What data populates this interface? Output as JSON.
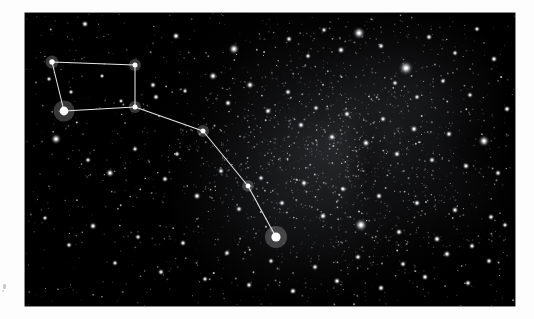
{
  "image": {
    "kind": "astronomical-photograph",
    "subject": "Big Dipper asterism in Ursa Major",
    "alt_text": "Black-and-white wide-field photograph of a dense star field with the Big Dipper asterism outlined by thin white connecting lines",
    "background_color": "#ffffff",
    "plate_color": "#000000",
    "line_color": "#e8e8e8",
    "star_color": "#ffffff",
    "frame": {
      "left": 25,
      "top": 13,
      "width": 490,
      "height": 293
    }
  },
  "chart_data": {
    "type": "scatter",
    "title": "",
    "subtitle": "",
    "xlabel": "",
    "ylabel": "",
    "grid": false,
    "legend": null,
    "xlim": [
      0,
      490
    ],
    "ylim": [
      0,
      293
    ],
    "constellation": {
      "name": "Big Dipper",
      "nodes": [
        {
          "id": "n1",
          "x": 27,
          "y": 49,
          "r": 2.7,
          "brightness": "bright"
        },
        {
          "id": "n2",
          "x": 110,
          "y": 52,
          "r": 2.5,
          "brightness": "bright"
        },
        {
          "id": "n3",
          "x": 110,
          "y": 94,
          "r": 2.5,
          "brightness": "bright"
        },
        {
          "id": "n4",
          "x": 39,
          "y": 98,
          "r": 4.4,
          "brightness": "very-bright"
        },
        {
          "id": "n5",
          "x": 178,
          "y": 118,
          "r": 2.5,
          "brightness": "bright"
        },
        {
          "id": "n6",
          "x": 223,
          "y": 173,
          "r": 2.4,
          "brightness": "bright"
        },
        {
          "id": "n7",
          "x": 251,
          "y": 224,
          "r": 4.6,
          "brightness": "very-bright"
        }
      ],
      "segments": [
        [
          "n1",
          "n2"
        ],
        [
          "n2",
          "n3"
        ],
        [
          "n3",
          "n4"
        ],
        [
          "n4",
          "n1"
        ],
        [
          "n3",
          "n5"
        ],
        [
          "n5",
          "n6"
        ],
        [
          "n6",
          "n7"
        ]
      ]
    },
    "field_stars": [
      {
        "x": 60,
        "y": 11,
        "r": 1.5
      },
      {
        "x": 151,
        "y": 23,
        "r": 1.6
      },
      {
        "x": 209,
        "y": 36,
        "r": 2.3
      },
      {
        "x": 264,
        "y": 26,
        "r": 1.4
      },
      {
        "x": 283,
        "y": 43,
        "r": 1.3
      },
      {
        "x": 299,
        "y": 17,
        "r": 1.3
      },
      {
        "x": 316,
        "y": 37,
        "r": 1.6
      },
      {
        "x": 334,
        "y": 20,
        "r": 2.6
      },
      {
        "x": 356,
        "y": 33,
        "r": 1.4
      },
      {
        "x": 381,
        "y": 55,
        "r": 3.0
      },
      {
        "x": 404,
        "y": 24,
        "r": 1.4
      },
      {
        "x": 430,
        "y": 40,
        "r": 1.3
      },
      {
        "x": 452,
        "y": 16,
        "r": 1.3
      },
      {
        "x": 469,
        "y": 46,
        "r": 1.5
      },
      {
        "x": 24,
        "y": 66,
        "r": 1.2
      },
      {
        "x": 46,
        "y": 79,
        "r": 1.2
      },
      {
        "x": 77,
        "y": 63,
        "r": 1.1
      },
      {
        "x": 96,
        "y": 88,
        "r": 1.1
      },
      {
        "x": 128,
        "y": 72,
        "r": 1.4
      },
      {
        "x": 131,
        "y": 84,
        "r": 1.4
      },
      {
        "x": 160,
        "y": 78,
        "r": 1.2
      },
      {
        "x": 188,
        "y": 63,
        "r": 1.8
      },
      {
        "x": 203,
        "y": 90,
        "r": 1.5
      },
      {
        "x": 225,
        "y": 72,
        "r": 1.7
      },
      {
        "x": 243,
        "y": 98,
        "r": 1.5
      },
      {
        "x": 263,
        "y": 79,
        "r": 1.4
      },
      {
        "x": 276,
        "y": 112,
        "r": 1.5
      },
      {
        "x": 291,
        "y": 95,
        "r": 1.3
      },
      {
        "x": 307,
        "y": 124,
        "r": 1.6
      },
      {
        "x": 322,
        "y": 101,
        "r": 1.5
      },
      {
        "x": 341,
        "y": 130,
        "r": 1.7
      },
      {
        "x": 358,
        "y": 106,
        "r": 1.4
      },
      {
        "x": 372,
        "y": 141,
        "r": 1.5
      },
      {
        "x": 389,
        "y": 116,
        "r": 1.6
      },
      {
        "x": 407,
        "y": 147,
        "r": 1.4
      },
      {
        "x": 424,
        "y": 121,
        "r": 1.5
      },
      {
        "x": 441,
        "y": 153,
        "r": 1.5
      },
      {
        "x": 459,
        "y": 128,
        "r": 2.4
      },
      {
        "x": 473,
        "y": 160,
        "r": 1.4
      },
      {
        "x": 31,
        "y": 126,
        "r": 2.2
      },
      {
        "x": 63,
        "y": 147,
        "r": 1.3
      },
      {
        "x": 85,
        "y": 160,
        "r": 1.8
      },
      {
        "x": 110,
        "y": 136,
        "r": 1.3
      },
      {
        "x": 140,
        "y": 166,
        "r": 1.4
      },
      {
        "x": 152,
        "y": 141,
        "r": 1.3
      },
      {
        "x": 172,
        "y": 183,
        "r": 1.6
      },
      {
        "x": 196,
        "y": 158,
        "r": 1.4
      },
      {
        "x": 214,
        "y": 196,
        "r": 1.4
      },
      {
        "x": 236,
        "y": 165,
        "r": 1.3
      },
      {
        "x": 257,
        "y": 190,
        "r": 1.4
      },
      {
        "x": 279,
        "y": 170,
        "r": 1.5
      },
      {
        "x": 298,
        "y": 203,
        "r": 1.6
      },
      {
        "x": 318,
        "y": 176,
        "r": 1.4
      },
      {
        "x": 336,
        "y": 212,
        "r": 2.7
      },
      {
        "x": 354,
        "y": 183,
        "r": 1.5
      },
      {
        "x": 374,
        "y": 219,
        "r": 1.5
      },
      {
        "x": 392,
        "y": 190,
        "r": 1.5
      },
      {
        "x": 412,
        "y": 226,
        "r": 1.6
      },
      {
        "x": 430,
        "y": 197,
        "r": 1.5
      },
      {
        "x": 447,
        "y": 233,
        "r": 1.4
      },
      {
        "x": 466,
        "y": 204,
        "r": 1.4
      },
      {
        "x": 20,
        "y": 205,
        "r": 1.2
      },
      {
        "x": 44,
        "y": 232,
        "r": 1.3
      },
      {
        "x": 68,
        "y": 213,
        "r": 1.6
      },
      {
        "x": 90,
        "y": 250,
        "r": 1.3
      },
      {
        "x": 113,
        "y": 224,
        "r": 1.3
      },
      {
        "x": 136,
        "y": 259,
        "r": 1.4
      },
      {
        "x": 158,
        "y": 230,
        "r": 1.4
      },
      {
        "x": 180,
        "y": 266,
        "r": 1.3
      },
      {
        "x": 202,
        "y": 240,
        "r": 1.4
      },
      {
        "x": 224,
        "y": 272,
        "r": 1.4
      },
      {
        "x": 246,
        "y": 248,
        "r": 1.3
      },
      {
        "x": 268,
        "y": 278,
        "r": 1.5
      },
      {
        "x": 290,
        "y": 254,
        "r": 1.4
      },
      {
        "x": 312,
        "y": 268,
        "r": 1.5
      },
      {
        "x": 333,
        "y": 244,
        "r": 1.4
      },
      {
        "x": 356,
        "y": 275,
        "r": 1.5
      },
      {
        "x": 378,
        "y": 251,
        "r": 1.4
      },
      {
        "x": 400,
        "y": 264,
        "r": 1.5
      },
      {
        "x": 422,
        "y": 241,
        "r": 1.6
      },
      {
        "x": 443,
        "y": 270,
        "r": 1.4
      },
      {
        "x": 464,
        "y": 248,
        "r": 1.4
      },
      {
        "x": 480,
        "y": 212,
        "r": 1.3
      },
      {
        "x": 482,
        "y": 96,
        "r": 1.5
      },
      {
        "x": 445,
        "y": 82,
        "r": 1.3
      },
      {
        "x": 418,
        "y": 68,
        "r": 1.3
      },
      {
        "x": 392,
        "y": 84,
        "r": 1.3
      },
      {
        "x": 370,
        "y": 70,
        "r": 1.3
      }
    ]
  }
}
